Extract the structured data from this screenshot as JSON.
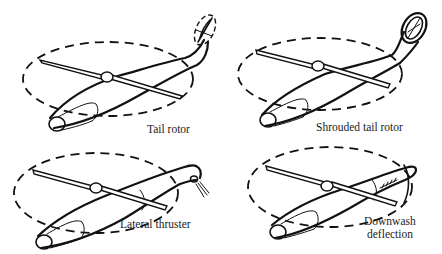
{
  "figure": {
    "colors": {
      "line": "#111111",
      "background": "#ffffff",
      "label": "#222222"
    },
    "panels": [
      {
        "id": "tail-rotor",
        "label": "Tail rotor"
      },
      {
        "id": "shrouded-tail-rotor",
        "label": "Shrouded tail rotor"
      },
      {
        "id": "lateral-thruster",
        "label": "Lateral thruster"
      },
      {
        "id": "downwash-deflection",
        "label_lines": [
          "Downwash",
          "deflection"
        ]
      }
    ]
  }
}
